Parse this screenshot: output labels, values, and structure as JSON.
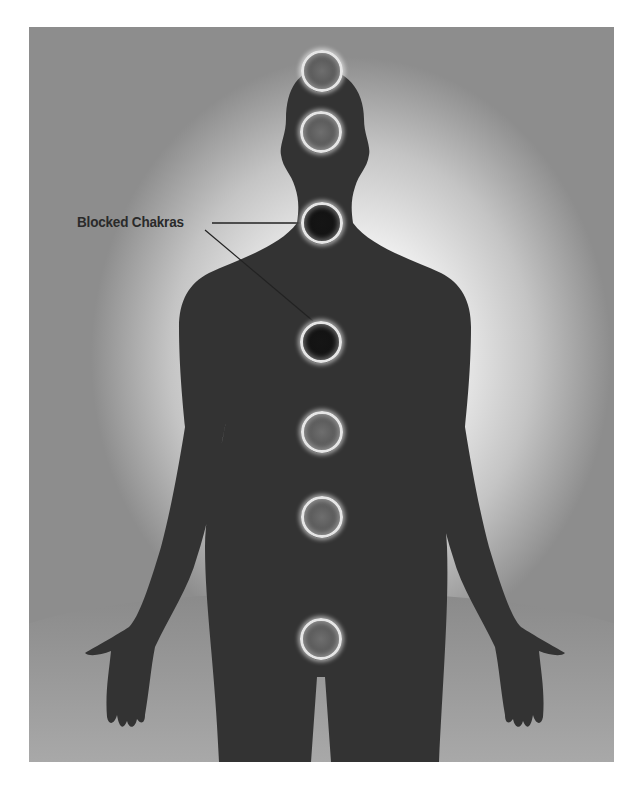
{
  "figure": {
    "label": "Blocked Chakras",
    "colors": {
      "silhouette": "#333333",
      "ring": "#e6e6e6",
      "open_chakra_core": "#5e5e5e",
      "blocked_chakra_core": "#141414",
      "halo": "#ffffff",
      "ground": "#9a9a9a"
    },
    "chakras": [
      {
        "name": "crown",
        "state": "open"
      },
      {
        "name": "third-eye",
        "state": "open"
      },
      {
        "name": "throat",
        "state": "blocked"
      },
      {
        "name": "heart",
        "state": "blocked"
      },
      {
        "name": "solar-plexus",
        "state": "open"
      },
      {
        "name": "sacral",
        "state": "open"
      },
      {
        "name": "root",
        "state": "open"
      }
    ]
  }
}
